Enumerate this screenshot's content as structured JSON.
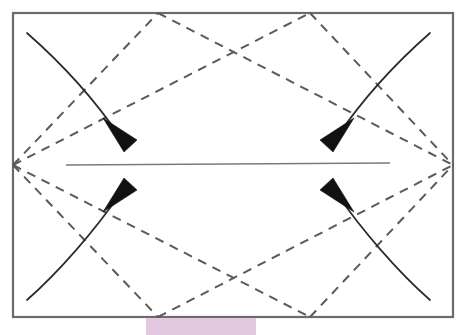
{
  "diagram": {
    "canvas": {
      "width": 467,
      "height": 335,
      "background_color": "#ffffff"
    },
    "sheet": {
      "label": "paper-sheet",
      "x": 13,
      "y": 13,
      "width": 440,
      "height": 304,
      "stroke_color": "#6b6b6b",
      "fill_color": "#ffffff"
    },
    "creases": {
      "dashed_style": "valley-fold-dashed",
      "dashed_color": "#5a5a5a",
      "solid_color": "#7a7a7a",
      "center_line": {
        "label": "horizontal-center-crease",
        "x1": 66,
        "y1": 165,
        "x2": 390,
        "y2": 163
      },
      "diamond_points": [
        {
          "label": "left-vertex",
          "x": 13,
          "y": 165
        },
        {
          "label": "top-left-vertex",
          "x": 158,
          "y": 13
        },
        {
          "label": "top-right-vertex",
          "x": 310,
          "y": 13
        },
        {
          "label": "right-vertex",
          "x": 453,
          "y": 165
        },
        {
          "label": "bottom-right-vertex",
          "x": 310,
          "y": 317
        },
        {
          "label": "bottom-left-vertex",
          "x": 158,
          "y": 317
        }
      ]
    },
    "arrows": [
      {
        "label": "top-left-fold-arrow",
        "direction": "down-right",
        "start_x": 27,
        "start_y": 33,
        "tip_x": 126,
        "tip_y": 152
      },
      {
        "label": "top-right-fold-arrow",
        "direction": "down-left",
        "start_x": 430,
        "start_y": 33,
        "tip_x": 329,
        "tip_y": 152
      },
      {
        "label": "bottom-left-fold-arrow",
        "direction": "up-right",
        "start_x": 27,
        "start_y": 300,
        "tip_x": 126,
        "tip_y": 177
      },
      {
        "label": "bottom-right-fold-arrow",
        "direction": "up-left",
        "start_x": 430,
        "start_y": 300,
        "tip_x": 329,
        "tip_y": 177
      }
    ],
    "highlight": {
      "label": "bottom-highlight-band",
      "color": "#e2c9e0",
      "x": 146,
      "y": 318,
      "width": 110,
      "height": 17,
      "caption": ""
    }
  }
}
